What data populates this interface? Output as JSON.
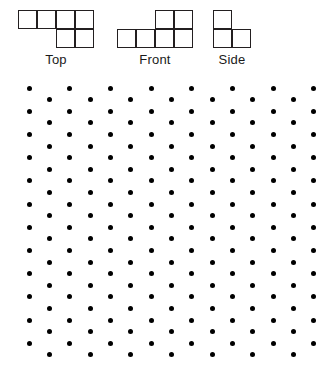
{
  "page": {
    "width": 328,
    "height": 369,
    "background": "#ffffff",
    "ink": "#231f20",
    "dot_color": "#000000"
  },
  "views": {
    "cell_size": 19,
    "stroke": "#231f20",
    "items": [
      {
        "id": "top-view",
        "label": "Top",
        "origin_x": 18,
        "origin_y": 10,
        "cols": 4,
        "rows": 2,
        "cells": [
          {
            "col": 0,
            "row": 0
          },
          {
            "col": 1,
            "row": 0
          },
          {
            "col": 2,
            "row": 0
          },
          {
            "col": 3,
            "row": 0
          },
          {
            "col": 2,
            "row": 1
          },
          {
            "col": 3,
            "row": 1
          }
        ]
      },
      {
        "id": "front-view",
        "label": "Front",
        "origin_x": 117,
        "origin_y": 10,
        "cols": 4,
        "rows": 2,
        "cells": [
          {
            "col": 2,
            "row": 0
          },
          {
            "col": 3,
            "row": 0
          },
          {
            "col": 0,
            "row": 1
          },
          {
            "col": 1,
            "row": 1
          },
          {
            "col": 2,
            "row": 1
          },
          {
            "col": 3,
            "row": 1
          }
        ]
      },
      {
        "id": "side-view",
        "label": "Side",
        "origin_x": 213,
        "origin_y": 10,
        "cols": 2,
        "rows": 2,
        "cells": [
          {
            "col": 0,
            "row": 0
          },
          {
            "col": 0,
            "row": 1
          },
          {
            "col": 1,
            "row": 1
          }
        ]
      }
    ]
  },
  "dot_grid": {
    "description": "isometric triangular dot lattice",
    "origin_x": 29,
    "origin_y": 16,
    "x_spacing": 40.7,
    "y_spacing": 11.6,
    "row_offset_x": 20.35,
    "rows": 24,
    "dots_per_row_even": 8,
    "dots_per_row_odd": 7,
    "dot_radius": 2.5,
    "dot_color": "#000000"
  }
}
